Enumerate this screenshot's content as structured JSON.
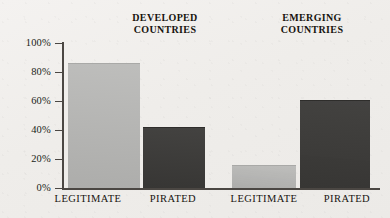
{
  "chart_data": {
    "type": "bar",
    "title": "",
    "xlabel": "",
    "ylabel": "",
    "ylim": [
      0,
      100
    ],
    "grid": false,
    "legend": "none",
    "groups": [
      {
        "label": "DEVELOPED\nCOUNTRIES"
      },
      {
        "label": "EMERGING\nCOUNTRIES"
      }
    ],
    "categories": [
      "LEGITIMATE",
      "PIRATED",
      "LEGITIMATE",
      "PIRATED"
    ],
    "values": [
      86,
      42,
      16,
      61
    ],
    "bars": [
      {
        "group": "DEVELOPED COUNTRIES",
        "category": "LEGITIMATE",
        "value": 86,
        "style": "light"
      },
      {
        "group": "DEVELOPED COUNTRIES",
        "category": "PIRATED",
        "value": 42,
        "style": "dark"
      },
      {
        "group": "EMERGING COUNTRIES",
        "category": "LEGITIMATE",
        "value": 16,
        "style": "light"
      },
      {
        "group": "EMERGING COUNTRIES",
        "category": "PIRATED",
        "value": 61,
        "style": "dark"
      }
    ],
    "yticks": [
      "0%",
      "20%",
      "40%",
      "60%",
      "80%",
      "100%"
    ],
    "ytick_values": [
      0,
      20,
      40,
      60,
      80,
      100
    ],
    "colors": {
      "light_bar": "#b6b6b4",
      "dark_bar": "#3b3a38",
      "axis": "#4b4743",
      "text": "#17140f",
      "background": "#f1efed"
    }
  }
}
